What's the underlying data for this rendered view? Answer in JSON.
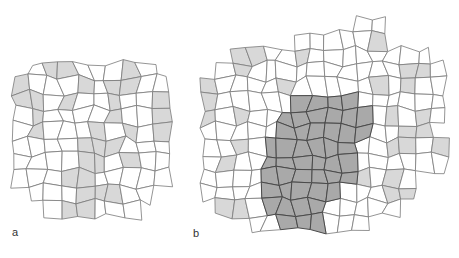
{
  "panels": [
    {
      "label": "a",
      "label_pos": [
        12,
        236
      ],
      "origin": [
        14,
        62
      ],
      "cell": 15.5,
      "cols": 10,
      "rows": 10,
      "shade_rows": [
        "..LL...L..",
        "L...L.LL..",
        "LL.L..L..L",
        ".L....L..L",
        ".L...L.L.L",
        "....LLL...",
        "....LL.L..",
        "...LL.....",
        "....LLL...",
        "...LL....."
      ],
      "mask_rows": [
        ".XXXXXXXX.",
        "XXXXXXXXXX",
        "XXXXXXXXXX",
        "XXXXXXXXXX",
        "XXXXXXXXXX",
        "XXXXXXXXXX",
        "XXXXXXXXXX",
        "XXXXXXXXXX",
        ".XXXXXXXX.",
        "..XXXXXX.."
      ]
    },
    {
      "label": "b",
      "label_pos": [
        193,
        237
      ],
      "origin": [
        203,
        18
      ],
      "cell": 15.2,
      "cols": 16,
      "rows": 14,
      "shade_rows": [
        "................",
        "...........L....",
        "..LL..L.........",
        "..L..........LL.",
        "L....L.....L.L..",
        "L.....DDDD......",
        "L.L..DDDDDD.L.L.",
        ".....DDDDDD..LL.",
        "..L.DDDDDD..LL.L",
        ".L..DDDDDD......",
        "....DDDDDDL.L...",
        "....DDDDD...LL..",
        ".LL.DDDD.....L..",
        ".....DDD........"
      ],
      "mask_rows": [
        "..........XX....",
        "......XXXXXX....",
        "..XXXXXXXXXXXXX.",
        ".XXXXXXXXXXXXXXX",
        "XXXXXXXXXXXXXXXX",
        "XXXXXXXXXXXXXXXX",
        "XXXXXXXXXXXXXXXX",
        "XXXXXXXXXXXXXXX.",
        "XXXXXXXXXXXXXXXX",
        "XXXXXXXXXXXXXXXX",
        "XXXXXXXXXXXXXX..",
        "XXXXXXXXXXXXXX..",
        ".XXXXXXXXXXXX...",
        "...XXXXXXXX....."
      ]
    }
  ],
  "colors": {
    "white": "#ffffff",
    "light": "#d8d8d8",
    "dark": "#a9a9a9",
    "stroke": "#7a7a7a",
    "dark_stroke": "#4a4a4a"
  }
}
